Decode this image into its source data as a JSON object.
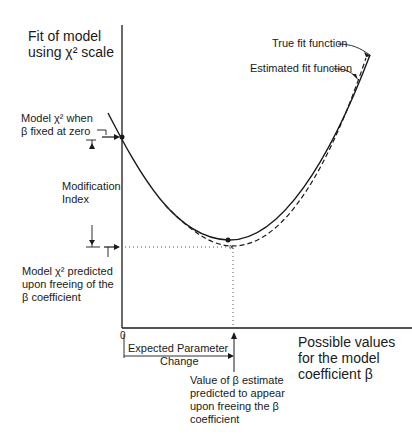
{
  "diagram": {
    "y_axis_label": [
      "Fit of model",
      "using χ² scale"
    ],
    "x_axis_label": [
      "Possible values",
      "for  the model",
      "coefficient β"
    ],
    "origin_label": "0",
    "curves": {
      "true_fit": "True fit function",
      "estimated_fit": "Estimated fit function"
    },
    "annotations": {
      "model_chi2_fixed": [
        "Model χ²  when",
        "β  fixed at zero"
      ],
      "modification_index": [
        "Modification",
        "Index"
      ],
      "model_chi2_predicted": [
        "Model χ²  predicted",
        "upon freeing of the",
        "β  coefficient"
      ],
      "expected_parameter_change": [
        "Expected Parameter",
        "Change"
      ],
      "beta_estimate": [
        "Value of  β  estimate",
        "predicted to appear",
        "upon freeing the β",
        "coefficient"
      ]
    },
    "colors": {
      "line": "#1a1a1a",
      "background": "#ffffff"
    }
  }
}
